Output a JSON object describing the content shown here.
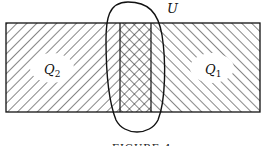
{
  "diagram": {
    "type": "region-overlap",
    "labels": {
      "left_region": {
        "main": "Q",
        "sub": "2"
      },
      "right_region": {
        "main": "Q",
        "sub": "1"
      },
      "oval": "U"
    },
    "caption": "FIGURE 4",
    "regions": [
      {
        "name": "Q2",
        "fill": "hatch-forward"
      },
      {
        "name": "Q1",
        "fill": "hatch-backward"
      },
      {
        "name": "overlap",
        "fill": "cross-hatch"
      }
    ],
    "colors": {
      "line": "#111111",
      "background": "#ffffff"
    }
  }
}
